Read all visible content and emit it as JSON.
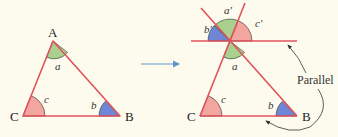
{
  "colors": {
    "background": "#fdfbee",
    "line": "#e0525c",
    "angle_a": "#a9d08e",
    "angle_b": "#6f86d6",
    "angle_c": "#f3a5a0",
    "arrow": "#5f97c7",
    "annotation": "#333333"
  },
  "left_triangle": {
    "vertices": {
      "A": "A",
      "B": "B",
      "C": "C"
    },
    "angles": {
      "a": "a",
      "b": "b",
      "c": "c"
    }
  },
  "transform_arrow": "right-arrow",
  "right_triangle": {
    "vertices": {
      "B": "B",
      "C": "C"
    },
    "angles": {
      "a": "a",
      "b": "b",
      "c": "c"
    },
    "copied_angles": {
      "a_prime": "a′",
      "b_prime": "b′",
      "c_prime": "c′"
    },
    "annotation": "Parallel"
  }
}
